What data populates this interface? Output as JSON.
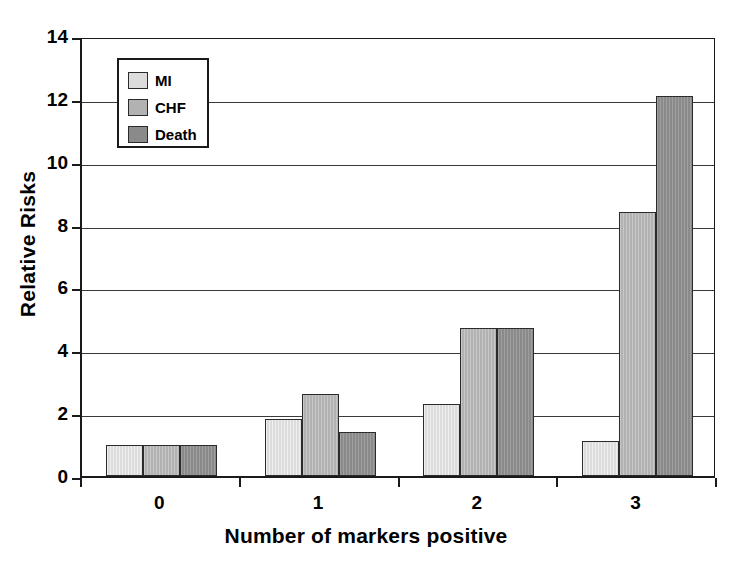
{
  "chart_data": {
    "type": "bar",
    "title": "",
    "xlabel": "Number of markers positive",
    "ylabel": "Relative Risks",
    "categories": [
      "0",
      "1",
      "2",
      "3"
    ],
    "ylim": [
      0,
      14
    ],
    "yticks": [
      0,
      2,
      4,
      6,
      8,
      10,
      12,
      14
    ],
    "grid": true,
    "legend_position": "upper left",
    "series": [
      {
        "name": "MI",
        "color": "#dcdcdc",
        "values": [
          1.0,
          1.8,
          2.3,
          1.1
        ]
      },
      {
        "name": "CHF",
        "color": "#b2b2b2",
        "values": [
          1.0,
          2.6,
          4.7,
          8.4
        ]
      },
      {
        "name": "Death",
        "color": "#8a8a8a",
        "values": [
          1.0,
          1.4,
          4.7,
          12.1
        ]
      }
    ]
  },
  "axes": {
    "y_title": "Relative Risks",
    "x_title": "Number of markers positive",
    "y_tick_labels": [
      "14",
      "12",
      "10",
      "8",
      "6",
      "4",
      "2",
      "0"
    ],
    "x_tick_labels": [
      "0",
      "1",
      "2",
      "3"
    ]
  },
  "legend": {
    "entries": [
      {
        "label": "MI"
      },
      {
        "label": "CHF"
      },
      {
        "label": "Death"
      }
    ]
  }
}
